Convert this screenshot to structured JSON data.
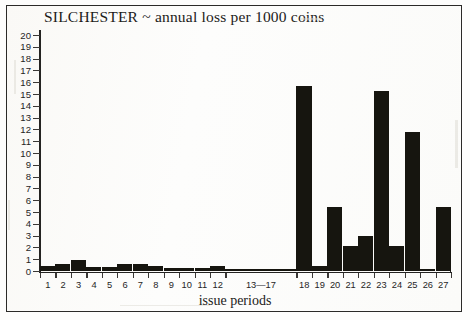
{
  "chart_data": {
    "type": "bar",
    "title": "SILCHESTER ~ annual loss per 1000 coins",
    "xlabel": "issue periods",
    "ylabel": "",
    "ylim": [
      0,
      20
    ],
    "grid": false,
    "legend": "none",
    "y_ticks": [
      0,
      1,
      2,
      3,
      4,
      5,
      6,
      7,
      8,
      9,
      10,
      11,
      12,
      13,
      14,
      15,
      16,
      17,
      18,
      19,
      20
    ],
    "categories": [
      "1",
      "2",
      "3",
      "4",
      "5",
      "6",
      "7",
      "8",
      "9",
      "10",
      "11",
      "12",
      "13—17",
      "18",
      "19",
      "20",
      "21",
      "22",
      "23",
      "24",
      "25",
      "26",
      "27"
    ],
    "values": [
      0.5,
      0.6,
      1.0,
      0.4,
      0.35,
      0.6,
      0.6,
      0.45,
      0.3,
      0.3,
      0.3,
      0.5,
      0.25,
      15.7,
      0.5,
      5.5,
      2.2,
      3.0,
      15.3,
      2.2,
      11.8,
      0.2,
      5.5
    ],
    "units": "loss per 1000 coins per year",
    "site": "SILCHESTER"
  },
  "colors": {
    "bar": "#16150f",
    "axis": "#242321",
    "frame": "#2b2a28",
    "background": "#fdfdfc",
    "text": "#1c1b19"
  },
  "figure": {
    "title": "SILCHESTER ~ annual loss per 1000 coins",
    "x_caption": "issue periods"
  }
}
